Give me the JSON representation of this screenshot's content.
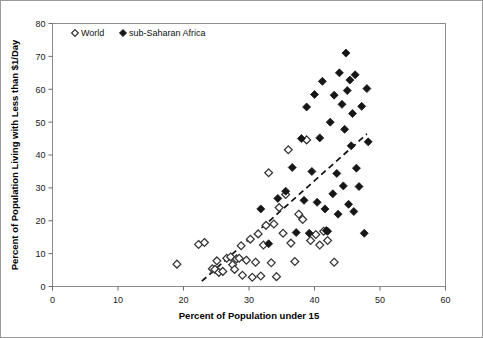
{
  "chart_data": {
    "type": "scatter",
    "title": "",
    "xlabel": "Percent of Population under 15",
    "ylabel": "Percent of Population Living with Less than $1/Day",
    "xlim": [
      0,
      60
    ],
    "ylim": [
      0,
      80
    ],
    "xticks": [
      0,
      10,
      20,
      30,
      40,
      50,
      60
    ],
    "yticks": [
      0,
      10,
      20,
      30,
      40,
      50,
      60,
      70,
      80
    ],
    "grid": false,
    "legend_position": "top-left-inside",
    "series": [
      {
        "name": "World",
        "marker": "open-diamond",
        "color": "#ffffff",
        "edge_color": "#333333",
        "points": [
          [
            19.0,
            6.8
          ],
          [
            22.3,
            12.8
          ],
          [
            23.2,
            13.4
          ],
          [
            24.4,
            5.4
          ],
          [
            24.8,
            5.2
          ],
          [
            25.1,
            7.8
          ],
          [
            25.4,
            4.3
          ],
          [
            26.0,
            4.6
          ],
          [
            26.6,
            8.6
          ],
          [
            27.2,
            9.0
          ],
          [
            27.5,
            6.6
          ],
          [
            27.8,
            5.2
          ],
          [
            28.1,
            8.4
          ],
          [
            28.5,
            8.6
          ],
          [
            28.8,
            12.4
          ],
          [
            29.0,
            3.4
          ],
          [
            29.6,
            8.0
          ],
          [
            30.2,
            14.4
          ],
          [
            30.5,
            2.8
          ],
          [
            31.0,
            7.4
          ],
          [
            31.4,
            16.0
          ],
          [
            31.8,
            3.2
          ],
          [
            32.2,
            12.6
          ],
          [
            32.6,
            18.6
          ],
          [
            33.0,
            34.6
          ],
          [
            33.4,
            7.2
          ],
          [
            33.8,
            19.0
          ],
          [
            34.2,
            3.0
          ],
          [
            34.6,
            24.0
          ],
          [
            35.2,
            16.2
          ],
          [
            35.6,
            28.0
          ],
          [
            36.0,
            41.6
          ],
          [
            36.4,
            13.2
          ],
          [
            37.0,
            7.6
          ],
          [
            37.6,
            22.0
          ],
          [
            38.2,
            20.4
          ],
          [
            38.8,
            44.6
          ],
          [
            39.4,
            14.0
          ],
          [
            40.2,
            15.8
          ],
          [
            40.8,
            12.6
          ],
          [
            41.4,
            16.8
          ],
          [
            42.0,
            14.0
          ],
          [
            43.0,
            7.4
          ]
        ]
      },
      {
        "name": "sub-Saharan Africa",
        "marker": "filled-diamond",
        "color": "#161616",
        "edge_color": "#161616",
        "points": [
          [
            31.8,
            23.6
          ],
          [
            33.0,
            13.0
          ],
          [
            34.4,
            26.8
          ],
          [
            35.6,
            29.0
          ],
          [
            36.6,
            36.2
          ],
          [
            37.2,
            16.4
          ],
          [
            38.0,
            45.0
          ],
          [
            38.4,
            26.2
          ],
          [
            38.8,
            54.6
          ],
          [
            39.2,
            16.2
          ],
          [
            39.6,
            35.0
          ],
          [
            40.0,
            58.4
          ],
          [
            40.4,
            25.6
          ],
          [
            40.8,
            45.2
          ],
          [
            41.2,
            62.4
          ],
          [
            41.6,
            23.6
          ],
          [
            41.8,
            17.0
          ],
          [
            42.0,
            16.8
          ],
          [
            42.4,
            50.0
          ],
          [
            42.8,
            28.2
          ],
          [
            43.0,
            58.2
          ],
          [
            43.4,
            34.4
          ],
          [
            43.6,
            22.0
          ],
          [
            43.8,
            65.0
          ],
          [
            44.2,
            55.4
          ],
          [
            44.4,
            30.6
          ],
          [
            44.6,
            47.8
          ],
          [
            44.8,
            71.0
          ],
          [
            45.0,
            59.6
          ],
          [
            45.2,
            25.0
          ],
          [
            45.4,
            62.8
          ],
          [
            45.6,
            42.8
          ],
          [
            45.8,
            52.6
          ],
          [
            46.0,
            22.8
          ],
          [
            46.2,
            64.4
          ],
          [
            46.4,
            36.0
          ],
          [
            46.8,
            30.4
          ],
          [
            47.2,
            54.8
          ],
          [
            47.6,
            16.2
          ],
          [
            48.0,
            60.2
          ],
          [
            48.2,
            44.0
          ]
        ]
      }
    ],
    "trendline": {
      "style": "dashed",
      "color": "#111111",
      "x_start": 22.8,
      "y_start": 1.6,
      "x_end": 48.0,
      "y_end": 46.4
    }
  }
}
